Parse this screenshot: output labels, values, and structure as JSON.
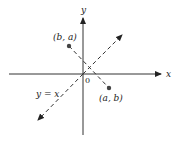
{
  "diagram": {
    "axes": {
      "x_label": "x",
      "y_label": "y",
      "origin_label": "0"
    },
    "line": {
      "label": "y = x",
      "style": "dashed"
    },
    "points": [
      {
        "id": "point-ab",
        "label": "(a, b)"
      },
      {
        "id": "point-ba",
        "label": "(b, a)"
      }
    ],
    "connector": {
      "style": "dashed",
      "description": "perpendicular segment from (b, a) to (a, b)"
    },
    "colors": {
      "stroke": "#333333",
      "point": "#444444",
      "background": "#ffffff"
    }
  }
}
